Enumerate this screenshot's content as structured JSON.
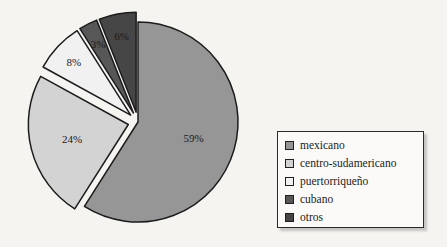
{
  "background_color": "#f6f4f0",
  "chart_data": {
    "type": "pie",
    "title": "",
    "xlabel": "",
    "ylabel": "",
    "legend_position": "right",
    "grid": false,
    "start_angle_deg": 0,
    "direction": "clockwise",
    "categories": [
      "mexicano",
      "centro-sudamericano",
      "puertorriqueño",
      "cubano",
      "otros"
    ],
    "values": [
      59,
      24,
      8,
      3,
      6
    ],
    "value_labels": [
      "59%",
      "24%",
      "8%",
      "3%",
      "6%"
    ],
    "colors": [
      "#969696",
      "#d3d3d3",
      "#f1f1f1",
      "#575757",
      "#464646"
    ],
    "exploded": [
      false,
      true,
      true,
      true,
      true
    ],
    "slices": [
      {
        "label": "mexicano",
        "value": 59,
        "value_label": "59%",
        "color": "#969696",
        "exploded": false
      },
      {
        "label": "centro-sudamericano",
        "value": 24,
        "value_label": "24%",
        "color": "#d3d3d3",
        "exploded": true
      },
      {
        "label": "puertorriqueño",
        "value": 8,
        "value_label": "8%",
        "color": "#f1f1f1",
        "exploded": true
      },
      {
        "label": "cubano",
        "value": 3,
        "value_label": "3%",
        "color": "#575757",
        "exploded": true
      },
      {
        "label": "otros",
        "value": 6,
        "value_label": "6%",
        "color": "#464646",
        "exploded": true
      }
    ]
  },
  "legend": {
    "items": [
      {
        "label": "mexicano",
        "color": "#969696"
      },
      {
        "label": "centro-sudamericano",
        "color": "#d3d3d3"
      },
      {
        "label": "puertorriqueño",
        "color": "#f1f1f1"
      },
      {
        "label": "cubano",
        "color": "#575757"
      },
      {
        "label": "otros",
        "color": "#464646"
      }
    ]
  }
}
